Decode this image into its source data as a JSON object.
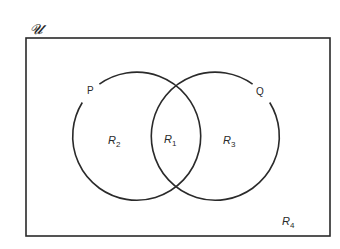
{
  "diagram": {
    "type": "venn",
    "universe": {
      "label": "𝓤"
    },
    "sets": [
      {
        "name": "P",
        "label": "P"
      },
      {
        "name": "Q",
        "label": "Q"
      }
    ],
    "regions": [
      {
        "id": "R1",
        "base": "R",
        "sub": "1",
        "meaning": "P ∩ Q"
      },
      {
        "id": "R2",
        "base": "R",
        "sub": "2",
        "meaning": "P only"
      },
      {
        "id": "R3",
        "base": "R",
        "sub": "3",
        "meaning": "Q only"
      },
      {
        "id": "R4",
        "base": "R",
        "sub": "4",
        "meaning": "outside P and Q"
      }
    ],
    "colors": {
      "stroke": "#2a2a2a",
      "background": "#ffffff"
    }
  }
}
